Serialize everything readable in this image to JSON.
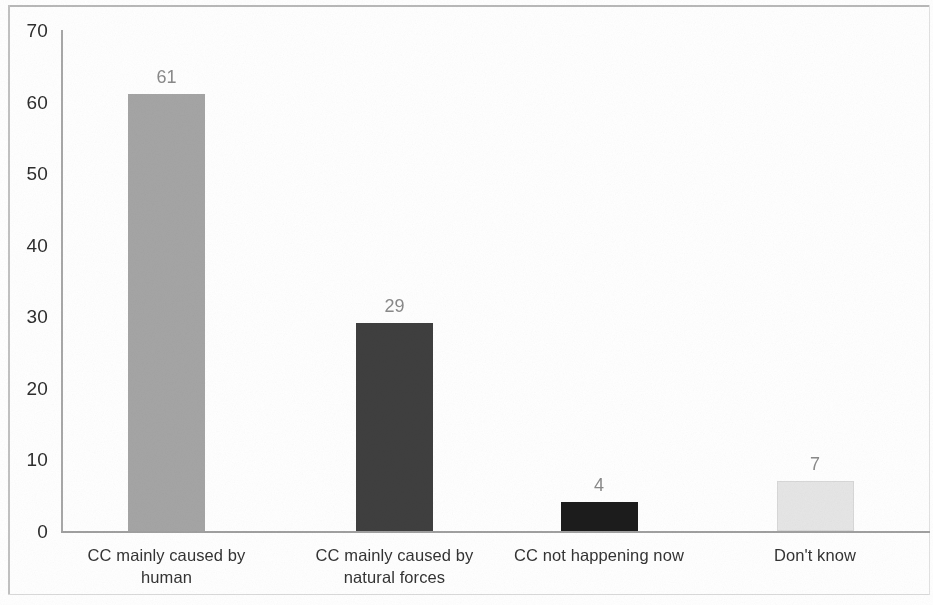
{
  "chart_data": {
    "type": "bar",
    "title": "",
    "subtitle": "",
    "xlabel": "",
    "ylabel": "",
    "categories": [
      "CC mainly caused by human",
      "CC mainly caused by natural forces",
      "CC not happening now",
      "Don't know"
    ],
    "values": [
      61,
      29,
      4,
      7
    ],
    "value_labels": [
      "61",
      "29",
      "4",
      "7"
    ],
    "ylim": [
      0,
      70
    ],
    "yticks": [
      0,
      10,
      20,
      30,
      40,
      50,
      60,
      70
    ],
    "ytick_labels": [
      "0",
      "10",
      "20",
      "30",
      "40",
      "50",
      "60",
      "70"
    ],
    "grid": false,
    "legend": false,
    "legend_position": "none",
    "bar_colors": [
      "#a5a5a5",
      "#3f3f3f",
      "#1c1c1c",
      "#e6e6e6"
    ],
    "bar_border_colors": [
      "#a5a5a5",
      "#3f3f3f",
      "#1c1c1c",
      "#d8d8d8"
    ],
    "value_label_color": "#8a8a8a",
    "axis_color": "#a0a0a0",
    "tick_label_color": "#2e2e2e",
    "category_label_color": "#343434",
    "background": "#ffffff"
  },
  "axis": {
    "y": {
      "ticks": [
        {
          "label": "70",
          "value": 70
        },
        {
          "label": "60",
          "value": 60
        },
        {
          "label": "50",
          "value": 50
        },
        {
          "label": "40",
          "value": 40
        },
        {
          "label": "30",
          "value": 30
        },
        {
          "label": "20",
          "value": 20
        },
        {
          "label": "10",
          "value": 10
        },
        {
          "label": "0",
          "value": 0
        }
      ]
    }
  },
  "bars": [
    {
      "category": "CC mainly caused by human",
      "label_line1": "CC mainly caused by",
      "label_line2": "human",
      "value": 61,
      "value_label": "61",
      "color": "#a5a5a5"
    },
    {
      "category": "CC mainly caused by natural forces",
      "label_line1": "CC mainly caused by",
      "label_line2": "natural forces",
      "value": 29,
      "value_label": "29",
      "color": "#3f3f3f"
    },
    {
      "category": "CC not happening now",
      "label_line1": "CC not happening now",
      "label_line2": "",
      "value": 4,
      "value_label": "4",
      "color": "#1c1c1c"
    },
    {
      "category": "Don't know",
      "label_line1": "Don't know",
      "label_line2": "",
      "value": 7,
      "value_label": "7",
      "color": "#e6e6e6"
    }
  ]
}
